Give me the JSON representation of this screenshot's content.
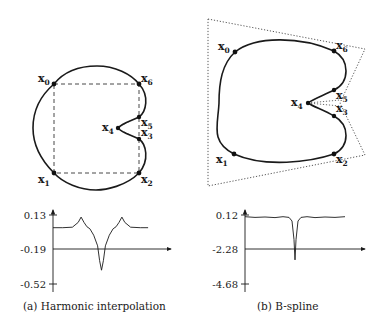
{
  "figure": {
    "panels": [
      {
        "id": "a",
        "caption": "(a) Harmonic interpolation",
        "method": "harmonic",
        "points": [
          {
            "label": "x",
            "sub": "0"
          },
          {
            "label": "x",
            "sub": "1"
          },
          {
            "label": "x",
            "sub": "2"
          },
          {
            "label": "x",
            "sub": "3"
          },
          {
            "label": "x",
            "sub": "4"
          },
          {
            "label": "x",
            "sub": "5"
          },
          {
            "label": "x",
            "sub": "6"
          }
        ],
        "polygon_style": "dashed"
      },
      {
        "id": "b",
        "caption": "(b) B-spline",
        "method": "bspline",
        "points": [
          {
            "label": "x",
            "sub": "0"
          },
          {
            "label": "x",
            "sub": "1"
          },
          {
            "label": "x",
            "sub": "2"
          },
          {
            "label": "x",
            "sub": "3"
          },
          {
            "label": "x",
            "sub": "4"
          },
          {
            "label": "x",
            "sub": "5"
          },
          {
            "label": "x",
            "sub": "6"
          }
        ],
        "polygon_style": "dotted"
      }
    ]
  },
  "chart_data": [
    {
      "type": "line",
      "title": "Curvature plot (Harmonic interpolation)",
      "xlabel": "",
      "ylabel": "",
      "yticks": [
        "0.13",
        "-0.19",
        "-0.52"
      ],
      "ytick_values": [
        0.13,
        -0.19,
        -0.52
      ],
      "ylim": [
        -0.52,
        0.13
      ],
      "xlim": [
        0,
        1
      ],
      "x": [
        0.0,
        0.1,
        0.2,
        0.26,
        0.29,
        0.32,
        0.35,
        0.38,
        0.42,
        0.46,
        0.48,
        0.5,
        0.52,
        0.54,
        0.58,
        0.62,
        0.65,
        0.68,
        0.71,
        0.74,
        0.8,
        0.9,
        0.98
      ],
      "values": [
        0.01,
        0.01,
        0.015,
        0.06,
        0.11,
        0.06,
        0.02,
        0.0,
        -0.06,
        -0.16,
        -0.3,
        -0.39,
        -0.3,
        -0.16,
        -0.06,
        0.0,
        0.02,
        0.06,
        0.11,
        0.06,
        0.015,
        0.01,
        0.01
      ]
    },
    {
      "type": "line",
      "title": "Curvature plot (B-spline)",
      "xlabel": "",
      "ylabel": "",
      "yticks": [
        "0.12",
        "-2.28",
        "-4.68"
      ],
      "ytick_values": [
        0.12,
        -2.28,
        -4.68
      ],
      "ylim": [
        -4.68,
        0.12
      ],
      "xlim": [
        0,
        1
      ],
      "x": [
        0.0,
        0.1,
        0.2,
        0.3,
        0.38,
        0.44,
        0.47,
        0.49,
        0.5,
        0.51,
        0.53,
        0.56,
        0.62,
        0.7,
        0.8,
        0.9,
        1.0
      ],
      "values": [
        0.0,
        -0.05,
        -0.02,
        -0.06,
        0.0,
        -0.05,
        -0.3,
        -1.6,
        -3.0,
        -1.6,
        -0.3,
        -0.05,
        0.0,
        -0.06,
        -0.02,
        -0.05,
        0.0
      ]
    }
  ]
}
